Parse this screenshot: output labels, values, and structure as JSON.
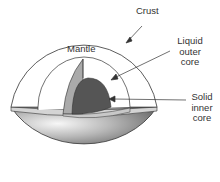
{
  "diagram": {
    "labels": {
      "crust": "Crust",
      "mantle": "Mantle",
      "outer_core": [
        "Liquid",
        "outer",
        "core"
      ],
      "inner_core": [
        "Solid",
        "inner",
        "core"
      ]
    },
    "colors": {
      "outline": "#333333",
      "mantle_section": "#aaaaaa",
      "inner_core": "#555555",
      "lower_hemisphere_light": "#f2f2f2",
      "lower_hemisphere_dark": "#6a6a6a",
      "cut_plane": "#d4d4d4"
    }
  }
}
